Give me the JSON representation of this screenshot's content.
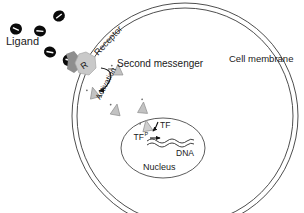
{
  "diagram": {
    "labels": {
      "ligand": "Ligand",
      "receptor": "Receptor",
      "receptor_short": "R",
      "second_messenger": "Second messenger",
      "activation": "Activation",
      "cell_membrane": "Cell membrane",
      "nucleus": "Nucleus",
      "dna": "DNA",
      "tf": "TF",
      "tf_phospho_base": "TF",
      "tf_phospho_sup": "P"
    },
    "colors": {
      "background": "#ffffff",
      "ligand": "#0a0a0a",
      "receptor": "#c9c9c9",
      "receptor_stem": "#8e8e8e",
      "second_messenger": "#c2c2c2",
      "membrane_line": "#3a3a3a",
      "nucleus_line": "#4a4a4a",
      "dna_line": "#2a2a2a",
      "text": "#1a1a1a",
      "arrow": "#111111"
    },
    "ligands": [
      {
        "name": "ligand-free-1",
        "cx": 16,
        "cy": 29,
        "rot": -10
      },
      {
        "name": "ligand-free-2",
        "cx": 40,
        "cy": 31,
        "rot": 10
      },
      {
        "name": "ligand-free-3",
        "cx": 59,
        "cy": 16,
        "rot": -30
      },
      {
        "name": "ligand-free-4",
        "cx": 50,
        "cy": 52,
        "rot": 15
      },
      {
        "name": "ligand-bound",
        "cx": 69,
        "cy": 60,
        "rot": -25
      }
    ],
    "second_messengers": [
      {
        "name": "messenger-near-receptor",
        "cx": 118,
        "cy": 70,
        "rot": 0
      },
      {
        "name": "messenger-activation",
        "cx": 94,
        "cy": 93,
        "rot": -15
      },
      {
        "name": "messenger-mid-left",
        "cx": 116,
        "cy": 110,
        "rot": 10
      },
      {
        "name": "messenger-mid-right",
        "cx": 143,
        "cy": 108,
        "rot": 5
      },
      {
        "name": "messenger-at-nucleus",
        "cx": 147,
        "cy": 126,
        "rot": -10
      }
    ],
    "geometry": {
      "cell_membrane_outer_r": 113,
      "cell_membrane_inner_r": 108,
      "cell_center": [
        185,
        116
      ],
      "nucleus_center": [
        163,
        148
      ],
      "nucleus_rx": 42,
      "nucleus_ry": 30
    }
  }
}
